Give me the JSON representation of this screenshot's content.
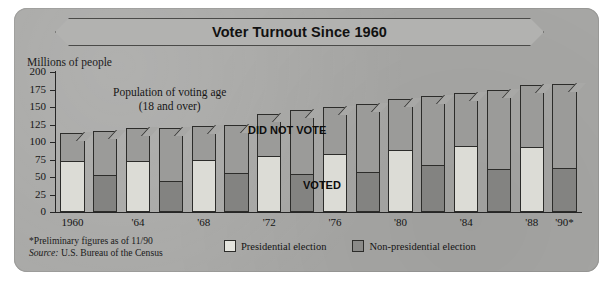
{
  "title": "Voter Turnout Since 1960",
  "axis": {
    "y_caption": "Millions of people",
    "y_ticks": [
      "200",
      "175",
      "150",
      "125",
      "100",
      "75",
      "50",
      "25",
      "0"
    ],
    "x_ticks": [
      "1960",
      "'64",
      "'68",
      "'72",
      "'76",
      "'80",
      "'84",
      "'88",
      "'90*"
    ]
  },
  "annotations": {
    "population_note_line1": "Population of voting age",
    "population_note_line2": "(18 and over)",
    "did_not_vote": "DID NOT VOTE",
    "voted": "VOTED"
  },
  "legend": {
    "presidential": "Presidential election",
    "non_presidential": "Non-presidential election"
  },
  "footnote": {
    "line1": "*Preliminary figures as of 11/90",
    "source_label": "Source:",
    "source_value": " U.S. Bureau of the Census"
  },
  "colors": {
    "card": "#a8a8a6",
    "did_not_vote_fill": "#9b9b99",
    "presidential_voted_fill": "#dcdcd6",
    "nonpresidential_voted_fill": "#838381",
    "outline": "#2c2c2a"
  },
  "chart_data": {
    "type": "bar",
    "title": "Voter Turnout Since 1960",
    "xlabel": "",
    "ylabel": "Millions of people",
    "ylim": [
      0,
      200
    ],
    "grid": false,
    "legend_position": "bottom",
    "stacked": true,
    "categories": [
      "1960",
      "1962",
      "1964",
      "1966",
      "1968",
      "1970",
      "1972",
      "1974",
      "1976",
      "1978",
      "1980",
      "1982",
      "1984",
      "1986",
      "1988",
      "1990"
    ],
    "tick_labels": [
      "1960",
      "",
      "'64",
      "",
      "'68",
      "",
      "'72",
      "",
      "'76",
      "",
      "'80",
      "",
      "'84",
      "",
      "'88",
      "'90*"
    ],
    "election_type": [
      "presidential",
      "non-presidential",
      "presidential",
      "non-presidential",
      "presidential",
      "non-presidential",
      "presidential",
      "non-presidential",
      "presidential",
      "non-presidential",
      "presidential",
      "non-presidential",
      "presidential",
      "non-presidential",
      "presidential",
      "non-presidential"
    ],
    "series": [
      {
        "name": "Voting age population",
        "values": [
          113,
          116,
          120,
          120,
          123,
          125,
          140,
          146,
          150,
          154,
          162,
          166,
          170,
          174,
          182,
          183
        ]
      },
      {
        "name": "VOTED",
        "values": [
          71,
          51,
          71,
          43,
          73,
          55,
          78,
          53,
          81,
          55,
          87,
          65,
          93,
          60,
          91,
          62
        ]
      }
    ],
    "derived_series": [
      {
        "name": "DID NOT VOTE",
        "values": [
          42,
          65,
          49,
          77,
          50,
          70,
          62,
          93,
          69,
          99,
          75,
          101,
          77,
          114,
          91,
          121
        ]
      }
    ]
  }
}
